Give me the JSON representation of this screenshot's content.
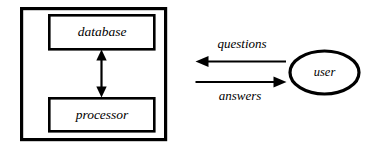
{
  "diagram": {
    "background_color": "#ffffff",
    "stroke_color": "#000000",
    "system": {
      "boundary_name": "system-boundary",
      "nodes": [
        {
          "id": "database",
          "label": "database",
          "shape": "rectangle"
        },
        {
          "id": "processor",
          "label": "processor",
          "shape": "rectangle"
        }
      ],
      "internal_edge": {
        "from": "database",
        "to": "processor",
        "direction": "bidirectional",
        "label": ""
      }
    },
    "actor": {
      "id": "user",
      "label": "user",
      "shape": "ellipse"
    },
    "flows": [
      {
        "id": "questions",
        "label": "questions",
        "from": "user",
        "to": "system",
        "direction": "left",
        "label_position": "above"
      },
      {
        "id": "answers",
        "label": "answers",
        "from": "system",
        "to": "user",
        "direction": "right",
        "label_position": "below"
      }
    ]
  }
}
